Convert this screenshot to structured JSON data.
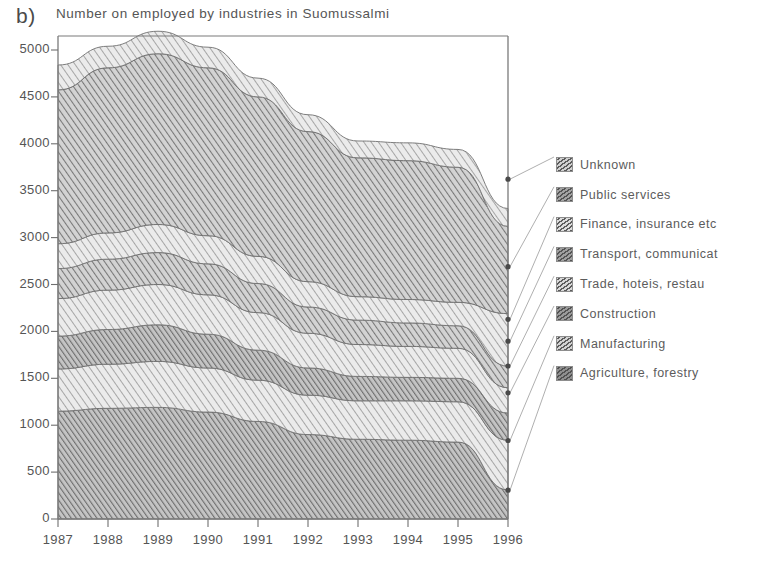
{
  "panel_label": "b)",
  "title": "Number on employed by industries in Suomussalmi",
  "chart_data": {
    "type": "area",
    "title": "Number on employed by industries in Suomussalmi",
    "subtitle": "",
    "xlabel": "",
    "ylabel": "",
    "stacked": true,
    "grid": false,
    "legend_position": "right",
    "legend_connector_lines": true,
    "x": [
      1987,
      1988,
      1989,
      1990,
      1991,
      1992,
      1993,
      1994,
      1995,
      1996
    ],
    "categories": [
      "1987",
      "1988",
      "1989",
      "1990",
      "1991",
      "1992",
      "1993",
      "1994",
      "1995",
      "1996"
    ],
    "xlim": [
      1987,
      1996
    ],
    "ylim": [
      0,
      5000
    ],
    "ytick_values": [
      0,
      500,
      1000,
      1500,
      2000,
      2500,
      3000,
      3500,
      4000,
      4500,
      5000
    ],
    "ytick_labels": [
      "0",
      "500",
      "1000",
      "1500",
      "2000",
      "2500",
      "3000",
      "3500",
      "4000",
      "4500",
      "5000"
    ],
    "xtick_labels": [
      "1987",
      "1988",
      "1989",
      "1990",
      "1991",
      "1992",
      "1993",
      "1994",
      "1995",
      "1996"
    ],
    "series_order_bottom_to_top": [
      "Agriculture, forestry",
      "Manufacturing",
      "Construction",
      "Trade, hoteis, restau",
      "Transport, communicat",
      "Finance, insurance etc",
      "Public services",
      "Unknown"
    ],
    "series": [
      {
        "name": "Agriculture, forestry",
        "legend_index": 7,
        "fill": "#8f8f8f",
        "hatch": "diagonal-dense",
        "values": [
          1150,
          1180,
          1190,
          1140,
          1040,
          900,
          850,
          840,
          820,
          310
        ]
      },
      {
        "name": "Manufacturing",
        "legend_index": 6,
        "fill": "#d2d2d2",
        "hatch": "diagonal-light",
        "values": [
          450,
          470,
          490,
          470,
          440,
          420,
          410,
          420,
          430,
          530
        ]
      },
      {
        "name": "Construction",
        "legend_index": 5,
        "fill": "#9a9a9a",
        "hatch": "diagonal-dense",
        "values": [
          350,
          370,
          390,
          360,
          320,
          290,
          260,
          250,
          250,
          290
        ]
      },
      {
        "name": "Trade, hoteis, restau",
        "legend_index": 4,
        "fill": "#d8d8d8",
        "hatch": "diagonal-light",
        "values": [
          400,
          420,
          430,
          420,
          400,
          370,
          340,
          330,
          320,
          270
        ]
      },
      {
        "name": "Transport, communicat",
        "legend_index": 3,
        "fill": "#9f9f9f",
        "hatch": "diagonal-medium",
        "values": [
          320,
          330,
          340,
          330,
          310,
          280,
          260,
          250,
          240,
          230
        ]
      },
      {
        "name": "Finance, insurance etc",
        "legend_index": 2,
        "fill": "#dcdcdc",
        "hatch": "diagonal-light",
        "values": [
          265,
          280,
          300,
          300,
          290,
          270,
          250,
          250,
          250,
          560
        ]
      },
      {
        "name": "Public services",
        "legend_index": 1,
        "fill": "#a3a3a3",
        "hatch": "diagonal-medium",
        "values": [
          1640,
          1760,
          1820,
          1790,
          1700,
          1600,
          1480,
          1480,
          1440,
          930
        ]
      },
      {
        "name": "Unknown",
        "legend_index": 0,
        "fill": "#cfcfcf",
        "hatch": "diagonal-light",
        "values": [
          265,
          230,
          240,
          220,
          200,
          180,
          180,
          190,
          190,
          190
        ]
      }
    ],
    "stack_totals": [
      4840,
      5040,
      5200,
      5030,
      4700,
      4310,
      4030,
      4010,
      3940,
      3310
    ],
    "endpoint_markers_1996": [
      {
        "series": "Unknown",
        "cumulative_value": 3623
      },
      {
        "series": "Public services",
        "cumulative_value": 2690
      },
      {
        "series": "Finance, insurance etc",
        "cumulative_value": 2129
      },
      {
        "series": "Transport, communicat",
        "cumulative_value": 1896
      },
      {
        "series": "Trade, hoteis, restau",
        "cumulative_value": 1631
      },
      {
        "series": "Construction",
        "cumulative_value": 1345
      },
      {
        "series": "Manufacturing",
        "cumulative_value": 837
      },
      {
        "series": "Agriculture, forestry",
        "cumulative_value": 307
      }
    ]
  },
  "legend": {
    "items": [
      {
        "label": "Unknown"
      },
      {
        "label": "Public services"
      },
      {
        "label": "Finance, insurance etc"
      },
      {
        "label": "Transport, communicat"
      },
      {
        "label": "Trade, hoteis, restau"
      },
      {
        "label": "Construction"
      },
      {
        "label": "Manufacturing"
      },
      {
        "label": "Agriculture, forestry"
      }
    ]
  },
  "colors": {
    "axis": "#6b6b6b",
    "text": "#555555",
    "background": "#ffffff"
  }
}
